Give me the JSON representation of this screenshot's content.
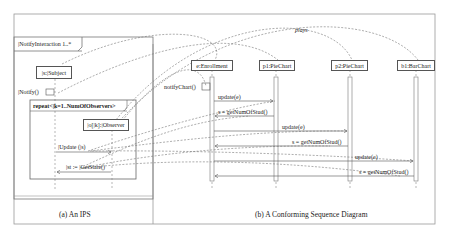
{
  "ips_panel": {
    "caption": "(a) An IPS",
    "frame_label": "|NotifyInteraction 1..*",
    "subject_lifeline": "|s:|Subject",
    "notify_message": "|Notify()",
    "loop_label": "repeat<|k=1..NumOfObservers>",
    "observer_lifeline": "|o[|k]:|Observer",
    "update_message": "|Update (|s)",
    "getstate_message": "|st := |GetState()"
  },
  "sequence_panel": {
    "caption": "(b) A Conforming Sequence Diagram",
    "lifelines": [
      "e:Enrollment",
      "p1:PieChart",
      "p2:PieChart",
      "b1:BarChart"
    ],
    "self_message": "notifyChart()",
    "messages": [
      {
        "label": "update(e)",
        "from": "e:Enrollment",
        "to": "p1:PieChart"
      },
      {
        "label": "s = getNumOfStud()",
        "from": "p1:PieChart",
        "to": "e:Enrollment"
      },
      {
        "label": "update(e)",
        "from": "e:Enrollment",
        "to": "p2:PieChart"
      },
      {
        "label": "s = getNumOfStud()",
        "from": "p2:PieChart",
        "to": "e:Enrollment"
      },
      {
        "label": "update(e)",
        "from": "e:Enrollment",
        "to": "b1:BarChart"
      },
      {
        "label": "s = getNumOfStud()",
        "from": "b1:BarChart",
        "to": "e:Enrollment"
      }
    ]
  },
  "mapping_label": "plays"
}
